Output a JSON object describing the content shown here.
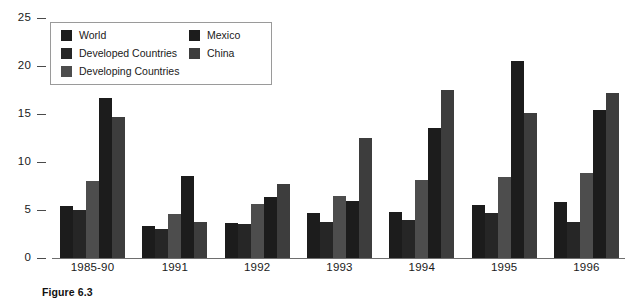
{
  "chart_data": {
    "type": "bar",
    "title": "",
    "xlabel": "",
    "ylabel": "",
    "ylim": [
      0,
      25
    ],
    "yticks": [
      0,
      5,
      10,
      15,
      20,
      25
    ],
    "grid": false,
    "legend_position": "top-left-inside",
    "categories": [
      "1985-90",
      "1991",
      "1992",
      "1993",
      "1994",
      "1995",
      "1996"
    ],
    "series": [
      {
        "name": "World",
        "color": "#1c1c1c",
        "values": [
          5.4,
          3.3,
          3.6,
          4.7,
          4.8,
          5.5,
          5.8
        ]
      },
      {
        "name": "Developed Countries",
        "color": "#262626",
        "values": [
          5.0,
          3.0,
          3.5,
          3.8,
          4.0,
          4.7,
          3.8
        ]
      },
      {
        "name": "Developing Countries",
        "color": "#4d4d4d",
        "values": [
          8.0,
          4.6,
          5.6,
          6.5,
          8.1,
          8.4,
          8.9
        ]
      },
      {
        "name": "Mexico",
        "color": "#1c1c1c",
        "values": [
          16.7,
          8.5,
          6.4,
          5.9,
          13.5,
          20.5,
          15.4
        ]
      },
      {
        "name": "China",
        "color": "#3d3d3d",
        "values": [
          14.7,
          3.8,
          7.7,
          12.5,
          17.5,
          15.1,
          17.2
        ]
      }
    ]
  },
  "legend": {
    "items": [
      {
        "label": "World",
        "swatch_color": "#1c1c1c"
      },
      {
        "label": "Developed Countries",
        "swatch_color": "#262626"
      },
      {
        "label": "Developing Countries",
        "swatch_color": "#4d4d4d"
      },
      {
        "label": "Mexico",
        "swatch_color": "#1c1c1c"
      },
      {
        "label": "China",
        "swatch_color": "#3d3d3d"
      }
    ]
  },
  "caption": {
    "text": "Figure 6.3"
  },
  "axis": {
    "y_tick_labels": [
      "25",
      "20",
      "15",
      "10",
      "5",
      "0"
    ],
    "x_tick_labels": [
      "1985-90",
      "1991",
      "1992",
      "1993",
      "1994",
      "1995",
      "1996"
    ]
  }
}
